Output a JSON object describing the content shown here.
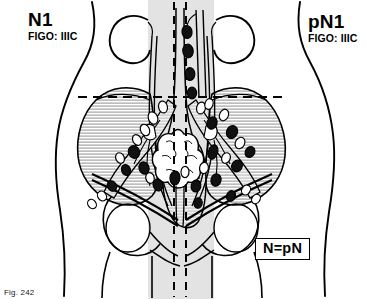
{
  "figure": {
    "title_left": "N1",
    "title_right": "pN1",
    "caption": "Fig. 242",
    "equivalence_note": "N=pN"
  },
  "labels": {
    "left": {
      "stage_code": "N1",
      "figo": "FIGO: IIIC",
      "side_name": "clinical-classification"
    },
    "right": {
      "stage_code": "pN1",
      "figo": "FIGO: IIIC",
      "side_name": "pathological-classification"
    }
  },
  "colors": {
    "ink": "#000000",
    "background": "#ffffff",
    "organ_shading": "#dedede",
    "bone_hatch": "#b4b4b4",
    "node_positive": "#111111",
    "node_negative": "#ffffff"
  },
  "legend": {
    "positive_node": "filled black oval = metastatic (positive) lymph node",
    "negative_node": "open white oval = non-metastatic lymph node",
    "dashed_vertical": "midline reference axis",
    "dashed_horizontal": "pelvic brim reference line"
  },
  "anatomy": [
    {
      "name": "body-outline",
      "visible": true
    },
    {
      "name": "kidney-left",
      "visible": true
    },
    {
      "name": "kidney-right",
      "visible": true
    },
    {
      "name": "ureter-left",
      "visible": true
    },
    {
      "name": "ureter-right",
      "visible": true
    },
    {
      "name": "aorta-vena-cava",
      "visible": true
    },
    {
      "name": "iliac-vessels",
      "visible": true
    },
    {
      "name": "uterus",
      "visible": true
    },
    {
      "name": "ovary-left",
      "visible": true
    },
    {
      "name": "ovary-right",
      "visible": true
    },
    {
      "name": "vagina",
      "visible": true
    },
    {
      "name": "ilium-left",
      "visible": true
    },
    {
      "name": "ilium-right",
      "visible": true
    },
    {
      "name": "sacrum",
      "visible": true
    },
    {
      "name": "femur-left",
      "visible": true
    },
    {
      "name": "femur-right",
      "visible": true
    },
    {
      "name": "inguinal-ligament-left",
      "visible": true
    },
    {
      "name": "inguinal-ligament-right",
      "visible": true
    }
  ],
  "nodes": {
    "positive_count": 19,
    "negative_count": 17,
    "positive": [
      {
        "cx": 187,
        "cy": 32,
        "rx": 5.0,
        "ry": 6.5,
        "rot": -8
      },
      {
        "cx": 188,
        "cy": 51,
        "rx": 5.2,
        "ry": 6.8,
        "rot": -6
      },
      {
        "cx": 190,
        "cy": 74,
        "rx": 4.8,
        "ry": 6.4,
        "rot": -4
      },
      {
        "cx": 192,
        "cy": 93,
        "rx": 4.6,
        "ry": 5.8,
        "rot": 0
      },
      {
        "cx": 212,
        "cy": 123,
        "rx": 5.0,
        "ry": 6.2,
        "rot": 20
      },
      {
        "cx": 232,
        "cy": 132,
        "rx": 5.4,
        "ry": 6.6,
        "rot": 25
      },
      {
        "cx": 213,
        "cy": 152,
        "rx": 4.6,
        "ry": 7.4,
        "rot": 18
      },
      {
        "cx": 134,
        "cy": 152,
        "rx": 5.6,
        "ry": 6.4,
        "rot": -25
      },
      {
        "cx": 144,
        "cy": 168,
        "rx": 5.0,
        "ry": 6.2,
        "rot": -18
      },
      {
        "cx": 126,
        "cy": 170,
        "rx": 4.4,
        "ry": 5.6,
        "rot": -20
      },
      {
        "cx": 158,
        "cy": 185,
        "rx": 4.8,
        "ry": 6.0,
        "rot": -12
      },
      {
        "cx": 175,
        "cy": 178,
        "rx": 5.0,
        "ry": 7.0,
        "rot": 6
      },
      {
        "cx": 196,
        "cy": 186,
        "rx": 4.8,
        "ry": 6.0,
        "rot": 10
      },
      {
        "cx": 216,
        "cy": 180,
        "rx": 5.0,
        "ry": 6.2,
        "rot": 16
      },
      {
        "cx": 237,
        "cy": 166,
        "rx": 5.2,
        "ry": 6.0,
        "rot": 28
      },
      {
        "cx": 250,
        "cy": 152,
        "rx": 4.6,
        "ry": 5.6,
        "rot": 32
      },
      {
        "cx": 112,
        "cy": 186,
        "rx": 4.4,
        "ry": 5.4,
        "rot": -30
      },
      {
        "cx": 198,
        "cy": 203,
        "rx": 4.2,
        "ry": 5.2,
        "rot": 8
      },
      {
        "cx": 231,
        "cy": 196,
        "rx": 4.4,
        "ry": 5.4,
        "rot": 22
      }
    ],
    "negative": [
      {
        "cx": 163,
        "cy": 107,
        "rx": 4.4,
        "ry": 6.0,
        "rot": -14
      },
      {
        "cx": 153,
        "cy": 118,
        "rx": 4.6,
        "ry": 6.4,
        "rot": -22
      },
      {
        "cx": 145,
        "cy": 130,
        "rx": 4.4,
        "ry": 6.0,
        "rot": -26
      },
      {
        "cx": 137,
        "cy": 140,
        "rx": 4.2,
        "ry": 5.6,
        "rot": -28
      },
      {
        "cx": 201,
        "cy": 108,
        "rx": 4.4,
        "ry": 6.0,
        "rot": 14
      },
      {
        "cx": 209,
        "cy": 104,
        "rx": 4.0,
        "ry": 5.4,
        "rot": 18
      },
      {
        "cx": 224,
        "cy": 115,
        "rx": 4.4,
        "ry": 6.0,
        "rot": 22
      },
      {
        "cx": 240,
        "cy": 143,
        "rx": 4.6,
        "ry": 6.0,
        "rot": 28
      },
      {
        "cx": 226,
        "cy": 158,
        "rx": 4.2,
        "ry": 5.4,
        "rot": 24
      },
      {
        "cx": 204,
        "cy": 168,
        "rx": 4.4,
        "ry": 5.6,
        "rot": 10
      },
      {
        "cx": 185,
        "cy": 172,
        "rx": 4.0,
        "ry": 5.6,
        "rot": 2
      },
      {
        "cx": 150,
        "cy": 178,
        "rx": 4.2,
        "ry": 5.4,
        "rot": -14
      },
      {
        "cx": 120,
        "cy": 158,
        "rx": 4.2,
        "ry": 5.4,
        "rot": -24
      },
      {
        "cx": 102,
        "cy": 196,
        "rx": 4.2,
        "ry": 5.2,
        "rot": -34
      },
      {
        "cx": 92,
        "cy": 204,
        "rx": 4.0,
        "ry": 5.0,
        "rot": -36
      },
      {
        "cx": 246,
        "cy": 190,
        "rx": 4.2,
        "ry": 5.2,
        "rot": 30
      },
      {
        "cx": 256,
        "cy": 199,
        "rx": 4.0,
        "ry": 5.0,
        "rot": 34
      }
    ]
  },
  "reference_lines": {
    "midline_dashed_x": [
      174,
      186
    ],
    "horizontal_dashed_y": 97,
    "horizontal_dashed_x_range": [
      78,
      288
    ]
  }
}
